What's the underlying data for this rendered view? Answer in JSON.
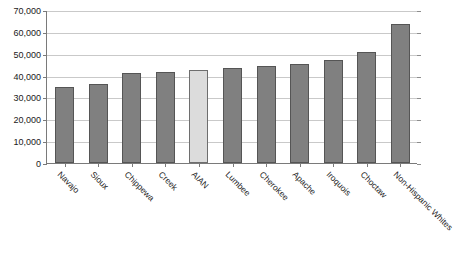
{
  "chart_data": {
    "type": "bar",
    "title": "",
    "xlabel": "",
    "ylabel": "",
    "ylim": [
      0,
      70000
    ],
    "ytick_values": [
      0,
      10000,
      20000,
      30000,
      40000,
      50000,
      60000,
      70000
    ],
    "ytick_labels": [
      "0",
      "10,000",
      "20,000",
      "30,000",
      "40,000",
      "50,000",
      "60,000",
      "70,000"
    ],
    "grid": true,
    "legend": "none",
    "categories": [
      "Navajo",
      "Sioux",
      "Chippewa",
      "Creek",
      "AIAN",
      "Lumbee",
      "Cherokee",
      "Apache",
      "Iroquois",
      "Choctaw",
      "Non-Hispanic Whites"
    ],
    "values": [
      34800,
      36200,
      41000,
      41800,
      42600,
      43400,
      44300,
      45200,
      47000,
      50800,
      63500
    ],
    "bar_styles": [
      "normal",
      "normal",
      "normal",
      "normal",
      "highlight",
      "normal",
      "normal",
      "normal",
      "normal",
      "normal",
      "normal"
    ],
    "colors": {
      "bar_fill": "#808080",
      "bar_border": "#555555",
      "highlight_fill": "#dcdcdc",
      "highlight_border": "#6e6e6e",
      "gridline": "#c9c9c9",
      "axis": "#7a7a7a",
      "background": "#ffffff",
      "text": "#1a1a1a"
    }
  }
}
